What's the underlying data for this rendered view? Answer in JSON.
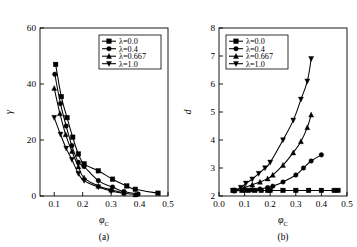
{
  "figure": {
    "panel_a_caption": "(a)",
    "panel_b_caption": "(b)"
  },
  "chart_data": [
    {
      "type": "line",
      "panel": "(a)",
      "title": "",
      "xlabel": "φ_C",
      "ylabel": "γ",
      "xlim": [
        0.05,
        0.5
      ],
      "ylim": [
        0,
        60
      ],
      "xticks": [
        "0.1",
        "0.2",
        "0.3",
        "0.4",
        "0.5"
      ],
      "xtick_values": [
        0.1,
        0.2,
        0.3,
        0.4,
        0.5
      ],
      "yticks": [
        "0",
        "20",
        "40",
        "60"
      ],
      "ytick_values": [
        0,
        20,
        40,
        60
      ],
      "grid": false,
      "legend_position": "upper-right",
      "series": [
        {
          "name": "λ=0.0",
          "marker": "square",
          "x": [
            0.105,
            0.125,
            0.145,
            0.165,
            0.185,
            0.205,
            0.255,
            0.305,
            0.355,
            0.385,
            0.465
          ],
          "values": [
            47.0,
            35.5,
            28.0,
            21.0,
            15.0,
            11.5,
            9.0,
            6.0,
            3.6,
            2.4,
            1.0
          ]
        },
        {
          "name": "λ=0.4",
          "marker": "circle",
          "x": [
            0.102,
            0.122,
            0.142,
            0.162,
            0.185,
            0.205,
            0.255,
            0.305,
            0.345,
            0.395
          ],
          "values": [
            43.5,
            33.0,
            25.0,
            18.0,
            12.0,
            10.5,
            5.5,
            3.2,
            1.6,
            0.7
          ]
        },
        {
          "name": "λ=0.667",
          "marker": "triangle-up",
          "x": [
            0.1,
            0.12,
            0.14,
            0.162,
            0.185,
            0.205,
            0.255,
            0.3,
            0.345,
            0.385
          ],
          "values": [
            38.5,
            29.5,
            22.0,
            16.0,
            10.5,
            6.5,
            3.6,
            2.2,
            1.1,
            0.5
          ]
        },
        {
          "name": "λ=1.0",
          "marker": "triangle-down",
          "x": [
            0.1,
            0.122,
            0.142,
            0.162,
            0.185,
            0.205,
            0.255,
            0.3,
            0.345
          ],
          "values": [
            28.0,
            22.0,
            17.0,
            13.0,
            8.0,
            5.5,
            3.2,
            1.8,
            0.9
          ]
        }
      ]
    },
    {
      "type": "line",
      "panel": "(b)",
      "title": "",
      "xlabel": "φ_C",
      "ylabel": "d",
      "xlim": [
        0.0,
        0.5
      ],
      "ylim": [
        2,
        8
      ],
      "xticks": [
        "0.0",
        "0.1",
        "0.2",
        "0.3",
        "0.4",
        "0.5"
      ],
      "xtick_values": [
        0.0,
        0.1,
        0.2,
        0.3,
        0.4,
        0.5
      ],
      "yticks": [
        "2",
        "3",
        "4",
        "5",
        "6",
        "7",
        "8"
      ],
      "ytick_values": [
        2,
        3,
        4,
        5,
        6,
        7,
        8
      ],
      "grid": false,
      "legend_position": "upper-left",
      "series": [
        {
          "name": "λ=0.0",
          "marker": "square",
          "x": [
            0.055,
            0.09,
            0.115,
            0.14,
            0.165,
            0.19,
            0.2,
            0.25,
            0.3,
            0.35,
            0.4,
            0.45,
            0.465
          ],
          "values": [
            2.2,
            2.2,
            2.2,
            2.2,
            2.2,
            2.2,
            2.2,
            2.2,
            2.2,
            2.2,
            2.2,
            2.2,
            2.2
          ]
        },
        {
          "name": "λ=0.4",
          "marker": "circle",
          "x": [
            0.06,
            0.1,
            0.13,
            0.16,
            0.19,
            0.21,
            0.25,
            0.3,
            0.33,
            0.36,
            0.4
          ],
          "values": [
            2.18,
            2.2,
            2.22,
            2.25,
            2.3,
            2.35,
            2.5,
            2.75,
            3.0,
            3.25,
            3.47
          ]
        },
        {
          "name": "λ=0.667",
          "marker": "triangle-up",
          "x": [
            0.06,
            0.1,
            0.13,
            0.16,
            0.19,
            0.21,
            0.25,
            0.29,
            0.32,
            0.345,
            0.36
          ],
          "values": [
            2.2,
            2.3,
            2.4,
            2.5,
            2.62,
            2.75,
            3.1,
            3.55,
            3.95,
            4.45,
            4.9
          ]
        },
        {
          "name": "λ=1.0",
          "marker": "triangle-down",
          "x": [
            0.06,
            0.085,
            0.105,
            0.13,
            0.155,
            0.18,
            0.2,
            0.25,
            0.29,
            0.32,
            0.345,
            0.36
          ],
          "values": [
            2.2,
            2.3,
            2.45,
            2.6,
            2.8,
            3.0,
            3.2,
            4.0,
            4.7,
            5.45,
            6.1,
            6.9
          ]
        }
      ]
    }
  ]
}
